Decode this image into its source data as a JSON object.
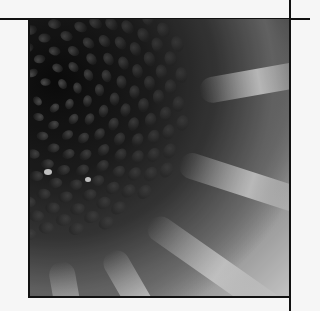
{
  "photo": {
    "subject": "coneflower seed head close-up",
    "tone": "grayscale halftone"
  },
  "colors": {
    "page_background": "#f6f6f6",
    "rule_color": "#111111",
    "center_dark": "#0c0c0c",
    "petal_light": "#dcdcdc"
  }
}
